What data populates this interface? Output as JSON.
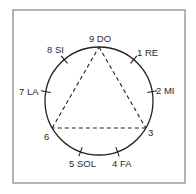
{
  "diagram": {
    "frame_color": "#8a8a8a",
    "stroke_color": "#222222",
    "circle": {
      "cx": 99,
      "cy": 101,
      "r": 54
    },
    "points": [
      {
        "number": "9",
        "note": "DO",
        "label": "9 DO",
        "angle_deg": 0
      },
      {
        "number": "1",
        "note": "RE",
        "label": "1 RE",
        "angle_deg": 40
      },
      {
        "number": "2",
        "note": "MI",
        "label": "2 MI",
        "angle_deg": 80
      },
      {
        "number": "3",
        "note": "",
        "label": "3",
        "angle_deg": 120
      },
      {
        "number": "4",
        "note": "FA",
        "label": "4 FA",
        "angle_deg": 160
      },
      {
        "number": "5",
        "note": "SOL",
        "label": "5 SOL",
        "angle_deg": 200
      },
      {
        "number": "6",
        "note": "",
        "label": "6",
        "angle_deg": 240
      },
      {
        "number": "7",
        "note": "LA",
        "label": "7 LA",
        "angle_deg": 280
      },
      {
        "number": "8",
        "note": "SI",
        "label": "8 SI",
        "angle_deg": 320
      }
    ],
    "triangle": {
      "vertices": [
        "9",
        "3",
        "6"
      ],
      "style": "dashed"
    }
  }
}
